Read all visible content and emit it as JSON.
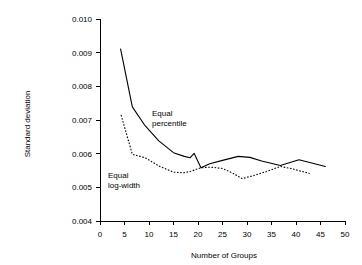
{
  "chart_data": {
    "type": "line",
    "title": "",
    "xlabel": "Number of Groups",
    "ylabel": "Standard deviation",
    "xlim": [
      0,
      50
    ],
    "ylim": [
      0.004,
      0.01
    ],
    "xticks": [
      "0",
      "5",
      "10",
      "15",
      "20",
      "25",
      "30",
      "35",
      "40",
      "45",
      "50"
    ],
    "xtick_values": [
      0,
      5,
      10,
      15,
      20,
      25,
      30,
      35,
      40,
      45,
      50
    ],
    "yticks": [
      "0.004",
      "0.005",
      "0.006",
      "0.007",
      "0.008",
      "0.009",
      "0.010"
    ],
    "ytick_values": [
      0.004,
      0.005,
      0.006,
      0.007,
      0.008,
      0.009,
      0.01
    ],
    "grid": false,
    "legend_position": "inline-annotations",
    "series": [
      {
        "name": "Equal percentile",
        "style": "solid",
        "color": "#000000",
        "x": [
          4.2,
          6.6,
          9.2,
          12.0,
          15.0,
          17.2,
          18.4,
          19.2,
          20.6,
          22.4,
          25.0,
          28.2,
          30.6,
          33.0,
          36.8,
          40.6,
          43.2,
          46.0
        ],
        "y": [
          0.00911,
          0.00739,
          0.00683,
          0.00638,
          0.00603,
          0.00592,
          0.00588,
          0.00601,
          0.00558,
          0.0057,
          0.0058,
          0.00592,
          0.00589,
          0.00578,
          0.00565,
          0.00582,
          0.00572,
          0.00562
        ]
      },
      {
        "name": "Equal log-width",
        "style": "dotted",
        "color": "#000000",
        "x": [
          4.3,
          6.6,
          9.2,
          12.2,
          15.0,
          17.0,
          18.6,
          20.6,
          22.6,
          25.0,
          27.0,
          29.0,
          31.4,
          34.0,
          36.8,
          39.0,
          41.0,
          42.8
        ],
        "y": [
          0.00715,
          0.00598,
          0.00588,
          0.00562,
          0.00545,
          0.00543,
          0.00548,
          0.00558,
          0.0056,
          0.00556,
          0.00543,
          0.00526,
          0.00535,
          0.00547,
          0.00562,
          0.00556,
          0.00548,
          0.00541
        ]
      }
    ],
    "annotations": [
      {
        "name": "equal-percentile",
        "line1": "Equal",
        "line2": "percentile",
        "x": 152,
        "y": 116
      },
      {
        "name": "equal-log-width",
        "line1": "Equal",
        "line2": "log-width",
        "x": 108,
        "y": 178
      }
    ]
  }
}
